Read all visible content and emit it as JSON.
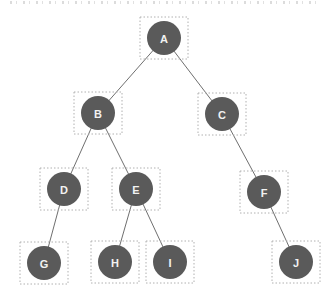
{
  "diagram": {
    "type": "tree",
    "node_radius": 17,
    "label_font_size": 11,
    "box": {
      "width": 48,
      "height": 42
    },
    "colors": {
      "node_fill": "#5a5a5a",
      "node_label": "#f2f2f2",
      "edge": "#6f6f6f",
      "box_border": "#b0b0b0",
      "background": "#ffffff"
    },
    "nodes": [
      {
        "id": "A",
        "label": "A",
        "x": 164,
        "y": 38
      },
      {
        "id": "B",
        "label": "B",
        "x": 98,
        "y": 113
      },
      {
        "id": "C",
        "label": "C",
        "x": 222,
        "y": 114
      },
      {
        "id": "D",
        "label": "D",
        "x": 64,
        "y": 189
      },
      {
        "id": "E",
        "label": "E",
        "x": 136,
        "y": 189
      },
      {
        "id": "F",
        "label": "F",
        "x": 264,
        "y": 192
      },
      {
        "id": "G",
        "label": "G",
        "x": 44,
        "y": 263
      },
      {
        "id": "H",
        "label": "H",
        "x": 115,
        "y": 262
      },
      {
        "id": "I",
        "label": "I",
        "x": 170,
        "y": 262
      },
      {
        "id": "J",
        "label": "J",
        "x": 296,
        "y": 262
      }
    ],
    "edges": [
      [
        "A",
        "B"
      ],
      [
        "A",
        "C"
      ],
      [
        "B",
        "D"
      ],
      [
        "B",
        "E"
      ],
      [
        "C",
        "F"
      ],
      [
        "D",
        "G"
      ],
      [
        "E",
        "H"
      ],
      [
        "E",
        "I"
      ],
      [
        "F",
        "J"
      ]
    ]
  }
}
